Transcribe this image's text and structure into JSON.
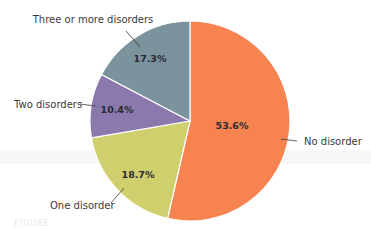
{
  "chart_data": {
    "type": "pie",
    "title": "",
    "categories": [
      "No disorder",
      "One disorder",
      "Two disorders",
      "Three or more disorders"
    ],
    "values": [
      53.6,
      18.7,
      10.4,
      17.3
    ],
    "value_labels": [
      "53.6%",
      "18.7%",
      "10.4%",
      "17.3%"
    ],
    "colors": [
      "#f68350",
      "#cfcf6e",
      "#8b79ad",
      "#7b939c"
    ],
    "start_angle_deg": 0,
    "direction": "clockwise",
    "legend": "none (callout labels with leader lines)"
  },
  "labels": {
    "no_disorder": "No disorder",
    "one_disorder": "One disorder",
    "two_disorders": "Two disorders",
    "three_or_more": "Three or more disorders"
  },
  "footer_text": "FIGURE"
}
